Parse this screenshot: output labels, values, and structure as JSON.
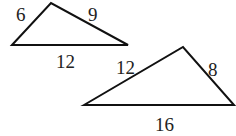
{
  "diagram": {
    "type": "similar-triangles",
    "triangles": [
      {
        "name": "small-triangle",
        "vertices": [
          [
            12,
            45
          ],
          [
            51,
            3
          ],
          [
            128,
            45
          ]
        ],
        "sides": {
          "left": "6",
          "right": "9",
          "base": "12"
        }
      },
      {
        "name": "large-triangle",
        "vertices": [
          [
            84,
            105
          ],
          [
            183,
            47
          ],
          [
            234,
            105
          ]
        ],
        "sides": {
          "left": "12",
          "right": "8",
          "base": "16"
        }
      }
    ],
    "stroke_color": "#111111"
  }
}
